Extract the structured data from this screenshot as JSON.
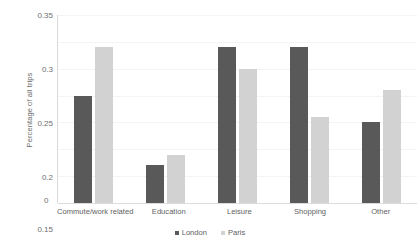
{
  "chart_data": {
    "type": "bar",
    "title": "",
    "subtitle": "",
    "xlabel": "",
    "ylabel": "Percentage of all trips",
    "ylim": [
      0,
      0.35
    ],
    "ytick_labels": [
      "0.35",
      "0.3",
      "0.25",
      "0.2",
      "0.15",
      "0.1",
      "0.05",
      "0"
    ],
    "ytick_values": [
      0.35,
      0.3,
      0.25,
      0.2,
      0.15,
      0.1,
      0.05,
      0
    ],
    "grid": true,
    "legend_position": "bottom",
    "categories": [
      "Commute/work related",
      "Education",
      "Leisure",
      "Shopping",
      "Other"
    ],
    "series": [
      {
        "name": "London",
        "color": "#595959",
        "values": [
          0.2,
          0.07,
          0.29,
          0.29,
          0.15
        ]
      },
      {
        "name": "Paris",
        "color": "#d2d2d2",
        "values": [
          0.29,
          0.09,
          0.25,
          0.16,
          0.21
        ]
      }
    ]
  },
  "legend": {
    "items": [
      {
        "label": "London",
        "color": "#595959"
      },
      {
        "label": "Paris",
        "color": "#d2d2d2"
      }
    ]
  },
  "colors": {
    "london": "#595959",
    "paris": "#d2d2d2",
    "gridline": "#f4f4f4",
    "axis": "#d9d9d9",
    "text": "#616161",
    "background": "#ffffff"
  }
}
